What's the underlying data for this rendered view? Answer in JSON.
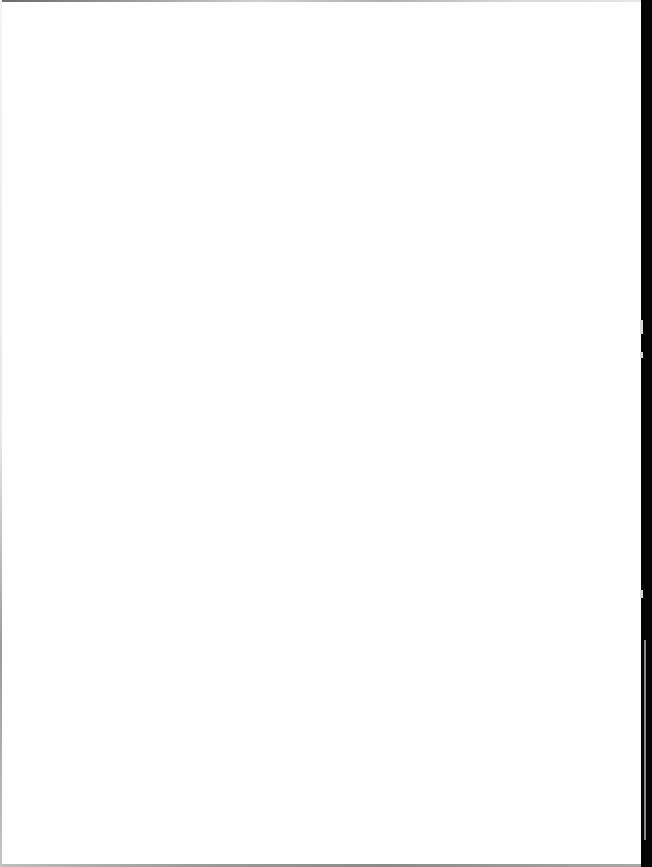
{
  "document": {
    "type": "scanned-page",
    "content": "",
    "is_blank": true
  },
  "colors": {
    "paper": "#fefefe",
    "scan_band": "#050505",
    "edge_shadow": "#9a9a9a"
  }
}
